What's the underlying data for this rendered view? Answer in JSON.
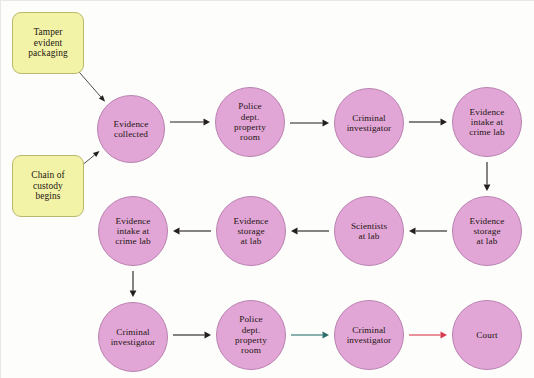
{
  "diagram": {
    "colors": {
      "circle_fill": "#e2a6d6",
      "circle_stroke": "#b981b0",
      "box_fill": "#f3f3a7",
      "box_stroke": "#b9b96e",
      "arrow_default": "#231f1c",
      "arrow_teal": "#2f6f6a",
      "arrow_red": "#d83a4e",
      "background": "#fdfdfb",
      "text": "#1d1512"
    },
    "nodes": [
      {
        "id": "tamper-evident-packaging",
        "shape": "rounded-box",
        "label": "Tamper\nevident\npackaging",
        "x": 12,
        "y": 12,
        "w": 72,
        "h": 62
      },
      {
        "id": "chain-of-custody-begins",
        "shape": "rounded-box",
        "label": "Chain of\ncustody\nbegins",
        "x": 12,
        "y": 155,
        "w": 72,
        "h": 62
      },
      {
        "id": "evidence-collected",
        "shape": "circle",
        "label": "Evidence\ncollected",
        "x": 97,
        "y": 95,
        "w": 68,
        "h": 68
      },
      {
        "id": "police-dept-property-room-1",
        "shape": "circle",
        "label": "Police\ndept.\nproperty\nroom",
        "x": 215,
        "y": 87,
        "w": 70,
        "h": 70
      },
      {
        "id": "criminal-investigator-1",
        "shape": "circle",
        "label": "Criminal\ninvestigator",
        "x": 334,
        "y": 88,
        "w": 70,
        "h": 70
      },
      {
        "id": "evidence-intake-at-crime-lab-1",
        "shape": "circle",
        "label": "Evidence\nintake at\ncrime lab",
        "x": 452,
        "y": 87,
        "w": 70,
        "h": 70
      },
      {
        "id": "evidence-storage-at-lab-right",
        "shape": "circle",
        "label": "Evidence\nstorage\nat lab",
        "x": 452,
        "y": 196,
        "w": 70,
        "h": 70
      },
      {
        "id": "scientists-at-lab",
        "shape": "circle",
        "label": "Scientists\nat lab",
        "x": 334,
        "y": 196,
        "w": 70,
        "h": 70
      },
      {
        "id": "evidence-storage-at-lab-middle",
        "shape": "circle",
        "label": "Evidence\nstorage\nat lab",
        "x": 216,
        "y": 196,
        "w": 70,
        "h": 70
      },
      {
        "id": "evidence-intake-at-crime-lab-2",
        "shape": "circle",
        "label": "Evidence\nintake at\ncrime lab",
        "x": 98,
        "y": 196,
        "w": 70,
        "h": 70
      },
      {
        "id": "criminal-investigator-2",
        "shape": "circle",
        "label": "Criminal\ninvestigator",
        "x": 98,
        "y": 302,
        "w": 70,
        "h": 70
      },
      {
        "id": "police-dept-property-room-2",
        "shape": "circle",
        "label": "Police\ndept.\nproperty\nroom",
        "x": 216,
        "y": 300,
        "w": 70,
        "h": 70
      },
      {
        "id": "criminal-investigator-3",
        "shape": "circle",
        "label": "Criminal\ninvestigator",
        "x": 334,
        "y": 300,
        "w": 70,
        "h": 70
      },
      {
        "id": "court",
        "shape": "circle",
        "label": "Court",
        "x": 452,
        "y": 300,
        "w": 70,
        "h": 70
      }
    ],
    "edges": [
      {
        "id": "tamper-to-evidence-collected",
        "from": "tamper-evident-packaging",
        "to": "evidence-collected",
        "color": "#231f1c",
        "style": "thin-diagonal"
      },
      {
        "id": "chain-to-evidence-collected",
        "from": "chain-of-custody-begins",
        "to": "evidence-collected",
        "color": "#231f1c",
        "style": "thin-diagonal"
      },
      {
        "id": "evidence-collected-to-property-room",
        "from": "evidence-collected",
        "to": "police-dept-property-room-1",
        "color": "#231f1c",
        "style": "horizontal-right"
      },
      {
        "id": "property-room-to-investigator",
        "from": "police-dept-property-room-1",
        "to": "criminal-investigator-1",
        "color": "#231f1c",
        "style": "horizontal-right"
      },
      {
        "id": "investigator-to-intake",
        "from": "criminal-investigator-1",
        "to": "evidence-intake-at-crime-lab-1",
        "color": "#231f1c",
        "style": "horizontal-right"
      },
      {
        "id": "intake-to-storage-down",
        "from": "evidence-intake-at-crime-lab-1",
        "to": "evidence-storage-at-lab-right",
        "color": "#231f1c",
        "style": "vertical-down"
      },
      {
        "id": "storage-right-to-scientists",
        "from": "evidence-storage-at-lab-right",
        "to": "scientists-at-lab",
        "color": "#231f1c",
        "style": "horizontal-left"
      },
      {
        "id": "scientists-to-storage-middle",
        "from": "scientists-at-lab",
        "to": "evidence-storage-at-lab-middle",
        "color": "#231f1c",
        "style": "horizontal-left"
      },
      {
        "id": "storage-middle-to-intake-2",
        "from": "evidence-storage-at-lab-middle",
        "to": "evidence-intake-at-crime-lab-2",
        "color": "#231f1c",
        "style": "horizontal-left"
      },
      {
        "id": "intake-2-to-investigator-2",
        "from": "evidence-intake-at-crime-lab-2",
        "to": "criminal-investigator-2",
        "color": "#231f1c",
        "style": "vertical-down"
      },
      {
        "id": "investigator-2-to-property-room-2",
        "from": "criminal-investigator-2",
        "to": "police-dept-property-room-2",
        "color": "#231f1c",
        "style": "horizontal-right"
      },
      {
        "id": "property-room-2-to-investigator-3",
        "from": "police-dept-property-room-2",
        "to": "criminal-investigator-3",
        "color": "#2f6f6a",
        "style": "horizontal-right"
      },
      {
        "id": "investigator-3-to-court",
        "from": "criminal-investigator-3",
        "to": "court",
        "color": "#d83a4e",
        "style": "horizontal-right"
      }
    ]
  }
}
